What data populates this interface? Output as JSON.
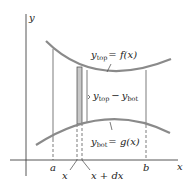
{
  "diagram": {
    "axes": {
      "x_label": "x",
      "y_label": "y"
    },
    "curves": {
      "top": {
        "lhs": "y",
        "lhs_sub": "top",
        "rhs": "= f(x)"
      },
      "bottom": {
        "lhs": "y",
        "lhs_sub": "bot",
        "rhs": "= g(x)"
      }
    },
    "strip_label": {
      "y1": "y",
      "sub1": "top",
      "minus": "−",
      "y2": "y",
      "sub2": "bot"
    },
    "ticks": {
      "a": "a",
      "b": "b",
      "x": "x",
      "x_dx": "x + dx"
    },
    "colors": {
      "curve": "#8a8a8a",
      "line": "#444444",
      "strip": "#c8c8c8"
    }
  }
}
